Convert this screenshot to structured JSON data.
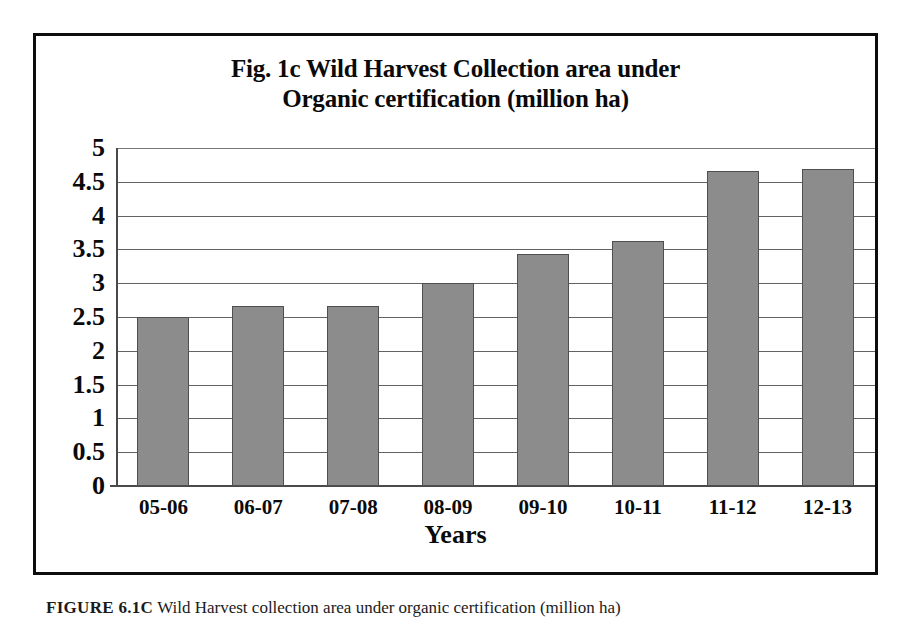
{
  "figure": {
    "caption_label": "FIGURE 6.1C",
    "caption_text": "Wild Harvest collection area under organic certification (million ha)"
  },
  "chart_data": {
    "type": "bar",
    "title": "Fig. 1c Wild Harvest Collection area under Organic certification (million ha)",
    "title_line1": "Fig. 1c Wild Harvest Collection area under",
    "title_line2": "Organic certification (million ha)",
    "xlabel": "Years",
    "ylabel": "",
    "categories": [
      "05-06",
      "06-07",
      "07-08",
      "08-09",
      "09-10",
      "10-11",
      "11-12",
      "12-13"
    ],
    "values": [
      2.5,
      2.66,
      2.66,
      3.0,
      3.43,
      3.63,
      4.66,
      4.69
    ],
    "ylim": [
      0,
      5
    ],
    "ytick_labels": [
      "5",
      "4.5",
      "4",
      "3.5",
      "3",
      "2.5",
      "2",
      "1.5",
      "1",
      "0.5",
      "0"
    ],
    "ytick_values": [
      5,
      4.5,
      4,
      3.5,
      3,
      2.5,
      2,
      1.5,
      1,
      0.5,
      0
    ],
    "grid": true,
    "legend": false,
    "series_color": "#8c8c8c",
    "series_border_color": "#4f4f4f",
    "grid_color": "#636363",
    "frame_color": "#0d0d0d",
    "text_color": "#0a0a0a"
  }
}
